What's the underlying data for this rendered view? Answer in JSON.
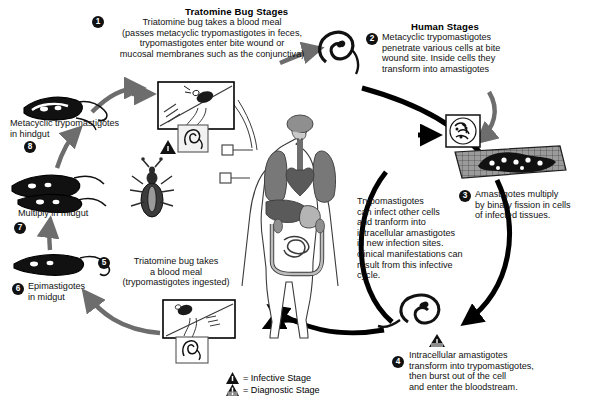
{
  "diagram": {
    "headers": {
      "vector": "Tratomine Bug Stages",
      "human": "Human Stages"
    },
    "stages": [
      {
        "number": "1",
        "num_label": "❶",
        "lines": [
          "Triatomine bug takes a blood meal",
          "(passes metacyclic trypomastigotes in feces,",
          "trypomastigotes enter bite wound or",
          "mucosal membranes such as the conjunctiva)"
        ]
      },
      {
        "number": "2",
        "num_label": "❷",
        "lines": [
          "Metacyclic trypomastigotes",
          "penetrate various cells at bite",
          "wound site. Inside cells they",
          "transform into amastigotes"
        ]
      },
      {
        "number": "3",
        "num_label": "❸",
        "lines": [
          "Amastigotes multiply",
          "by binary fission in cells",
          "of infected tissues."
        ]
      },
      {
        "number": "4",
        "num_label": "❹",
        "lines": [
          "Intracellular amastigotes",
          "transform into trypomastigotes,",
          "then burst out of the cell",
          "and enter the bloodstream."
        ]
      },
      {
        "number": "5",
        "num_label": "❺",
        "lines": [
          "Triatomine bug takes",
          "a blood meal",
          "(trypomastigotes ingested)"
        ]
      },
      {
        "number": "6",
        "num_label": "❻",
        "lines": [
          "Epimastigotes",
          "in midgut"
        ]
      },
      {
        "number": "7",
        "num_label": "❼",
        "lines": [
          "Multiply in midgut"
        ]
      },
      {
        "number": "8",
        "num_label": "❽",
        "lines": [
          "Metacyclic trypomastigotes",
          "in hindgut"
        ]
      }
    ],
    "note": {
      "lines": [
        "Trypomastigotes",
        "can infect other cells",
        "and tranform into",
        "intracellular amastigotes",
        "in new infection sites.",
        "clinical manifestations can",
        "result from this infective",
        "cycle."
      ]
    },
    "legend": {
      "infective": "= Infective Stage",
      "diagnostic": "= Diagnostic Stage"
    },
    "colors": {
      "ink": "#111111",
      "arrow_gray": "#6d6d6d",
      "arrow_black": "#000000",
      "organ_mid": "#8a8a8a",
      "organ_dark": "#5a5a5a",
      "organ_light": "#c2c2c2",
      "background": "#ffffff"
    },
    "icons": {
      "infective": "filled-triangle-icon",
      "diagnostic": "outline-triangle-icon"
    }
  }
}
